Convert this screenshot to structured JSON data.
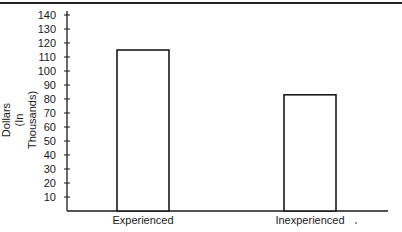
{
  "chart_data": {
    "type": "bar",
    "title": "",
    "xlabel": "",
    "ylabel": "Dollars (In Thousands)",
    "ylabel_lines": [
      "Dollars",
      "(In Thousands)"
    ],
    "categories": [
      "Experienced",
      "Inexperienced"
    ],
    "values": [
      115,
      83
    ],
    "ylim": [
      0,
      140
    ],
    "yticks": [
      10,
      20,
      30,
      40,
      50,
      60,
      70,
      80,
      90,
      100,
      110,
      120,
      130,
      140
    ],
    "grid": false,
    "legend": null,
    "bar_fill": "#ffffff",
    "bar_stroke": "#1a1a1a"
  }
}
